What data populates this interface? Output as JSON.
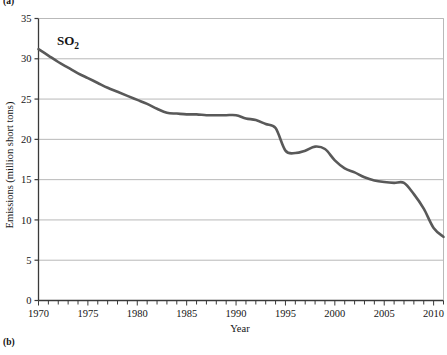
{
  "figure": {
    "panel_label_top": "(a)",
    "panel_label_bottom": "(b)"
  },
  "chart_data": {
    "type": "line",
    "title": "",
    "series_label": "SO",
    "series_label_subscript": "2",
    "xlabel": "Year",
    "ylabel": "Emissions (million short tons)",
    "xlim": [
      1970,
      2011
    ],
    "ylim": [
      0,
      35
    ],
    "ytick_step": 5,
    "xtick_major_step": 5,
    "xtick_minor_step": 1,
    "grid": "horizontal",
    "legend": "none",
    "line_color": "#595959",
    "grid_color": "#b9b9b9",
    "axis_color": "#3a3a3a",
    "xticks": [
      1970,
      1975,
      1980,
      1985,
      1990,
      1995,
      2000,
      2005,
      2010
    ],
    "xtick_labels": [
      "1970",
      "1975",
      "1980",
      "1985",
      "1990",
      "1995",
      "2000",
      "2005",
      "2010"
    ],
    "yticks": [
      0,
      5,
      10,
      15,
      20,
      25,
      30,
      35
    ],
    "ytick_labels": [
      "0",
      "5",
      "10",
      "15",
      "20",
      "25",
      "30",
      "35"
    ],
    "x": [
      1970,
      1971,
      1972,
      1973,
      1974,
      1975,
      1976,
      1977,
      1978,
      1979,
      1980,
      1981,
      1982,
      1983,
      1984,
      1985,
      1986,
      1987,
      1988,
      1989,
      1990,
      1991,
      1992,
      1993,
      1994,
      1995,
      1996,
      1997,
      1998,
      1999,
      2000,
      2001,
      2002,
      2003,
      2004,
      2005,
      2006,
      2007,
      2008,
      2009,
      2010,
      2011
    ],
    "values": [
      31.2,
      30.4,
      29.6,
      28.9,
      28.2,
      27.6,
      27.0,
      26.4,
      25.9,
      25.4,
      24.9,
      24.4,
      23.8,
      23.3,
      23.2,
      23.1,
      23.1,
      23.0,
      23.0,
      23.0,
      23.0,
      22.6,
      22.4,
      21.9,
      21.4,
      18.6,
      18.3,
      18.6,
      19.1,
      18.8,
      17.4,
      16.4,
      15.9,
      15.3,
      14.9,
      14.7,
      14.6,
      14.6,
      13.2,
      11.4,
      9.0,
      7.9
    ]
  }
}
